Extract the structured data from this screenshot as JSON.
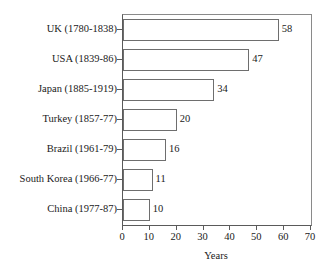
{
  "chart_data": {
    "type": "bar",
    "orientation": "horizontal",
    "title": "",
    "xlabel": "Years",
    "ylabel": "",
    "xlim": [
      0,
      70
    ],
    "xticks": [
      "0",
      "10",
      "20",
      "30",
      "40",
      "50",
      "60",
      "70"
    ],
    "grid": false,
    "legend": "none",
    "categories": [
      "UK (1780-1838)",
      "USA (1839-86)",
      "Japan (1885-1919)",
      "Turkey (1857-77)",
      "Brazil (1961-79)",
      "South Korea (1966-77)",
      "China (1977-87)"
    ],
    "values": [
      58,
      47,
      34,
      20,
      16,
      11,
      10
    ],
    "value_labels": [
      "58",
      "47",
      "34",
      "20",
      "16",
      "11",
      "10"
    ],
    "colors": {
      "bar_fill": "#ffffff",
      "bar_stroke": "#6e6e6e",
      "axis": "#5a5a5a",
      "frame": "#8a8a8a",
      "text": "#1a1a1a",
      "background": "#ffffff"
    }
  }
}
